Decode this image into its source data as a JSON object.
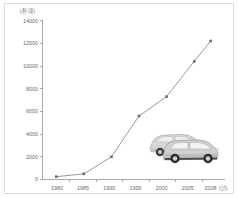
{
  "chart_data": {
    "type": "line",
    "title": "",
    "subtitle": "",
    "xlabel": "(년)",
    "ylabel": "(천 대)",
    "x": [
      1980,
      1985,
      1990,
      1995,
      2000,
      2005,
      2008
    ],
    "categories": [
      "1980",
      "1985",
      "1990",
      "1995",
      "2000",
      "2005",
      "2008"
    ],
    "values": [
      250,
      500,
      2000,
      5600,
      7300,
      10400,
      12200
    ],
    "series": [
      {
        "name": "자동차 등록 대수",
        "values": [
          250,
          500,
          2000,
          5600,
          7300,
          10400,
          12200
        ]
      }
    ],
    "ylim": [
      0,
      14000
    ],
    "ytick_labels": [
      "0",
      "2000",
      "4000",
      "6000",
      "8000",
      "10000",
      "12000",
      "14000"
    ],
    "ytick_values": [
      0,
      2000,
      4000,
      6000,
      8000,
      10000,
      12000,
      14000
    ],
    "xtick_labels": [
      "1980",
      "1985",
      "1990",
      "1995",
      "2000",
      "2005",
      "2008"
    ],
    "xlim": [
      1977.5,
      2010.5
    ],
    "grid": false,
    "legend": "none",
    "markers": true,
    "line_color": "#8d8d8d",
    "marker_color": "#6e6e6e",
    "axis_color": "#a8a8a8",
    "text_color": "#6b6b6b",
    "background_color": "#ffffff",
    "border_color": "#dcdcdc",
    "annotations": [
      {
        "name": "car-illustration",
        "description": "두 대의 회색 자동차 그림"
      }
    ]
  },
  "axis_unit_labels": {
    "y_unit": "(천 대)",
    "x_unit": "(년)"
  },
  "icons": {
    "car": "car-icon"
  }
}
